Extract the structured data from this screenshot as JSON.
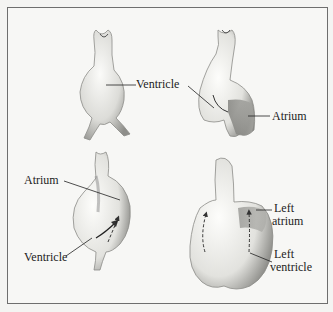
{
  "figure": {
    "panels": [
      {
        "id": "stage-1",
        "position": "top-left",
        "labels": [
          {
            "text": "Ventricle"
          }
        ]
      },
      {
        "id": "stage-2",
        "position": "top-right",
        "labels": [
          {
            "text": "Ventricle"
          },
          {
            "text": "Atrium"
          }
        ]
      },
      {
        "id": "stage-3",
        "position": "bottom-left",
        "labels": [
          {
            "text": "Atrium"
          },
          {
            "text": "Ventricle"
          }
        ]
      },
      {
        "id": "stage-4",
        "position": "bottom-right",
        "labels": [
          {
            "text": "Left"
          },
          {
            "text": "atrium"
          },
          {
            "text": "Left"
          },
          {
            "text": "ventricle"
          }
        ]
      }
    ]
  },
  "colors": {
    "border": "#6e6e6e",
    "background": "#f7f7f5",
    "organ_fill": "#e9e9e6",
    "organ_shade": "#9a9a96",
    "ink": "#1c1c1c"
  }
}
